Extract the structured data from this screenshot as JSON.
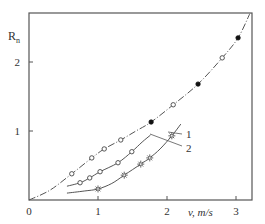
{
  "chart_data": {
    "type": "line",
    "title": "",
    "xlabel": "v, m/s",
    "ylabel": "R_n",
    "ylabel_main": "R",
    "ylabel_sub": "n",
    "xlim": [
      0,
      3.2
    ],
    "ylim": [
      0,
      2.7
    ],
    "x_ticks": [
      "0",
      "1",
      "2",
      "3"
    ],
    "y_ticks": [
      "1",
      "2"
    ],
    "grid": false,
    "legend": "none (curves labelled inline with leader lines)",
    "annotations": [
      {
        "text": "1",
        "target": "middle curve (open circles)"
      },
      {
        "text": "2",
        "target": "lower curve (stars)"
      }
    ],
    "series": [
      {
        "name": "upper curve (dash-dot, open + filled circles)",
        "line_style": "dash-dot",
        "curve": [
          [
            0,
            0
          ],
          [
            0.3,
            0.14
          ],
          [
            0.62,
            0.38
          ],
          [
            0.91,
            0.61
          ],
          [
            1.09,
            0.74
          ],
          [
            1.33,
            0.87
          ],
          [
            1.55,
            1.0
          ],
          [
            1.77,
            1.13
          ],
          [
            2.09,
            1.38
          ],
          [
            2.45,
            1.68
          ],
          [
            2.8,
            2.06
          ],
          [
            3.03,
            2.35
          ],
          [
            3.2,
            2.7
          ]
        ],
        "open_markers": [
          [
            0.62,
            0.38
          ],
          [
            0.91,
            0.61
          ],
          [
            1.09,
            0.74
          ],
          [
            1.33,
            0.87
          ],
          [
            2.09,
            1.38
          ],
          [
            2.8,
            2.06
          ]
        ],
        "filled_markers": [
          [
            1.77,
            1.13
          ],
          [
            2.45,
            1.68
          ],
          [
            3.03,
            2.35
          ]
        ]
      },
      {
        "name": "1",
        "line_style": "solid",
        "curve": [
          [
            0.55,
            0.2
          ],
          [
            0.74,
            0.25
          ],
          [
            0.88,
            0.32
          ],
          [
            1.03,
            0.41
          ],
          [
            1.29,
            0.54
          ],
          [
            1.49,
            0.7
          ],
          [
            1.64,
            0.84
          ],
          [
            1.76,
            0.94
          ]
        ],
        "open_markers": [
          [
            0.74,
            0.25
          ],
          [
            0.88,
            0.32
          ],
          [
            1.03,
            0.41
          ],
          [
            1.29,
            0.54
          ],
          [
            1.49,
            0.7
          ]
        ],
        "filled_markers": []
      },
      {
        "name": "2",
        "line_style": "solid",
        "curve": [
          [
            0.55,
            0.1
          ],
          [
            0.8,
            0.13
          ],
          [
            1.0,
            0.16
          ],
          [
            1.2,
            0.24
          ],
          [
            1.38,
            0.36
          ],
          [
            1.62,
            0.52
          ],
          [
            1.75,
            0.61
          ],
          [
            1.9,
            0.74
          ],
          [
            2.07,
            0.93
          ],
          [
            2.2,
            1.1
          ]
        ],
        "star_markers": [
          [
            1.0,
            0.16
          ],
          [
            1.38,
            0.36
          ],
          [
            1.62,
            0.52
          ],
          [
            1.75,
            0.61
          ],
          [
            2.07,
            0.93
          ]
        ]
      }
    ]
  }
}
